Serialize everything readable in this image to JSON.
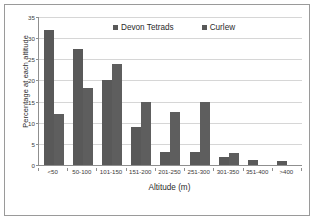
{
  "chart_data": {
    "type": "bar",
    "title": "",
    "xlabel": "Altitude (m)",
    "ylabel": "Percentage at each altitude",
    "categories": [
      "<50",
      "50-100",
      "101-150",
      "151-200",
      "201-250",
      "251-300",
      "301-350",
      "351-400",
      ">400"
    ],
    "series": [
      {
        "name": "Devon Tetrads",
        "color": "#595959",
        "values": [
          32,
          27.5,
          20,
          9,
          3,
          3,
          2,
          1.3,
          1
        ]
      },
      {
        "name": "Curlew",
        "color": "#5e5e5e",
        "values": [
          12,
          18.3,
          24,
          15,
          12.5,
          15,
          2.8,
          0,
          0
        ]
      }
    ],
    "ylim": [
      0,
      35
    ],
    "yticks": [
      35,
      30,
      25,
      20,
      15,
      10,
      5,
      0
    ],
    "grid": true,
    "legend_position": "top-center"
  },
  "legend": {
    "items": [
      {
        "label": "Devon Tetrads"
      },
      {
        "label": "Curlew"
      }
    ]
  },
  "axes": {
    "y_title": "Percentage at each altitude",
    "x_title": "Altitude (m)"
  }
}
